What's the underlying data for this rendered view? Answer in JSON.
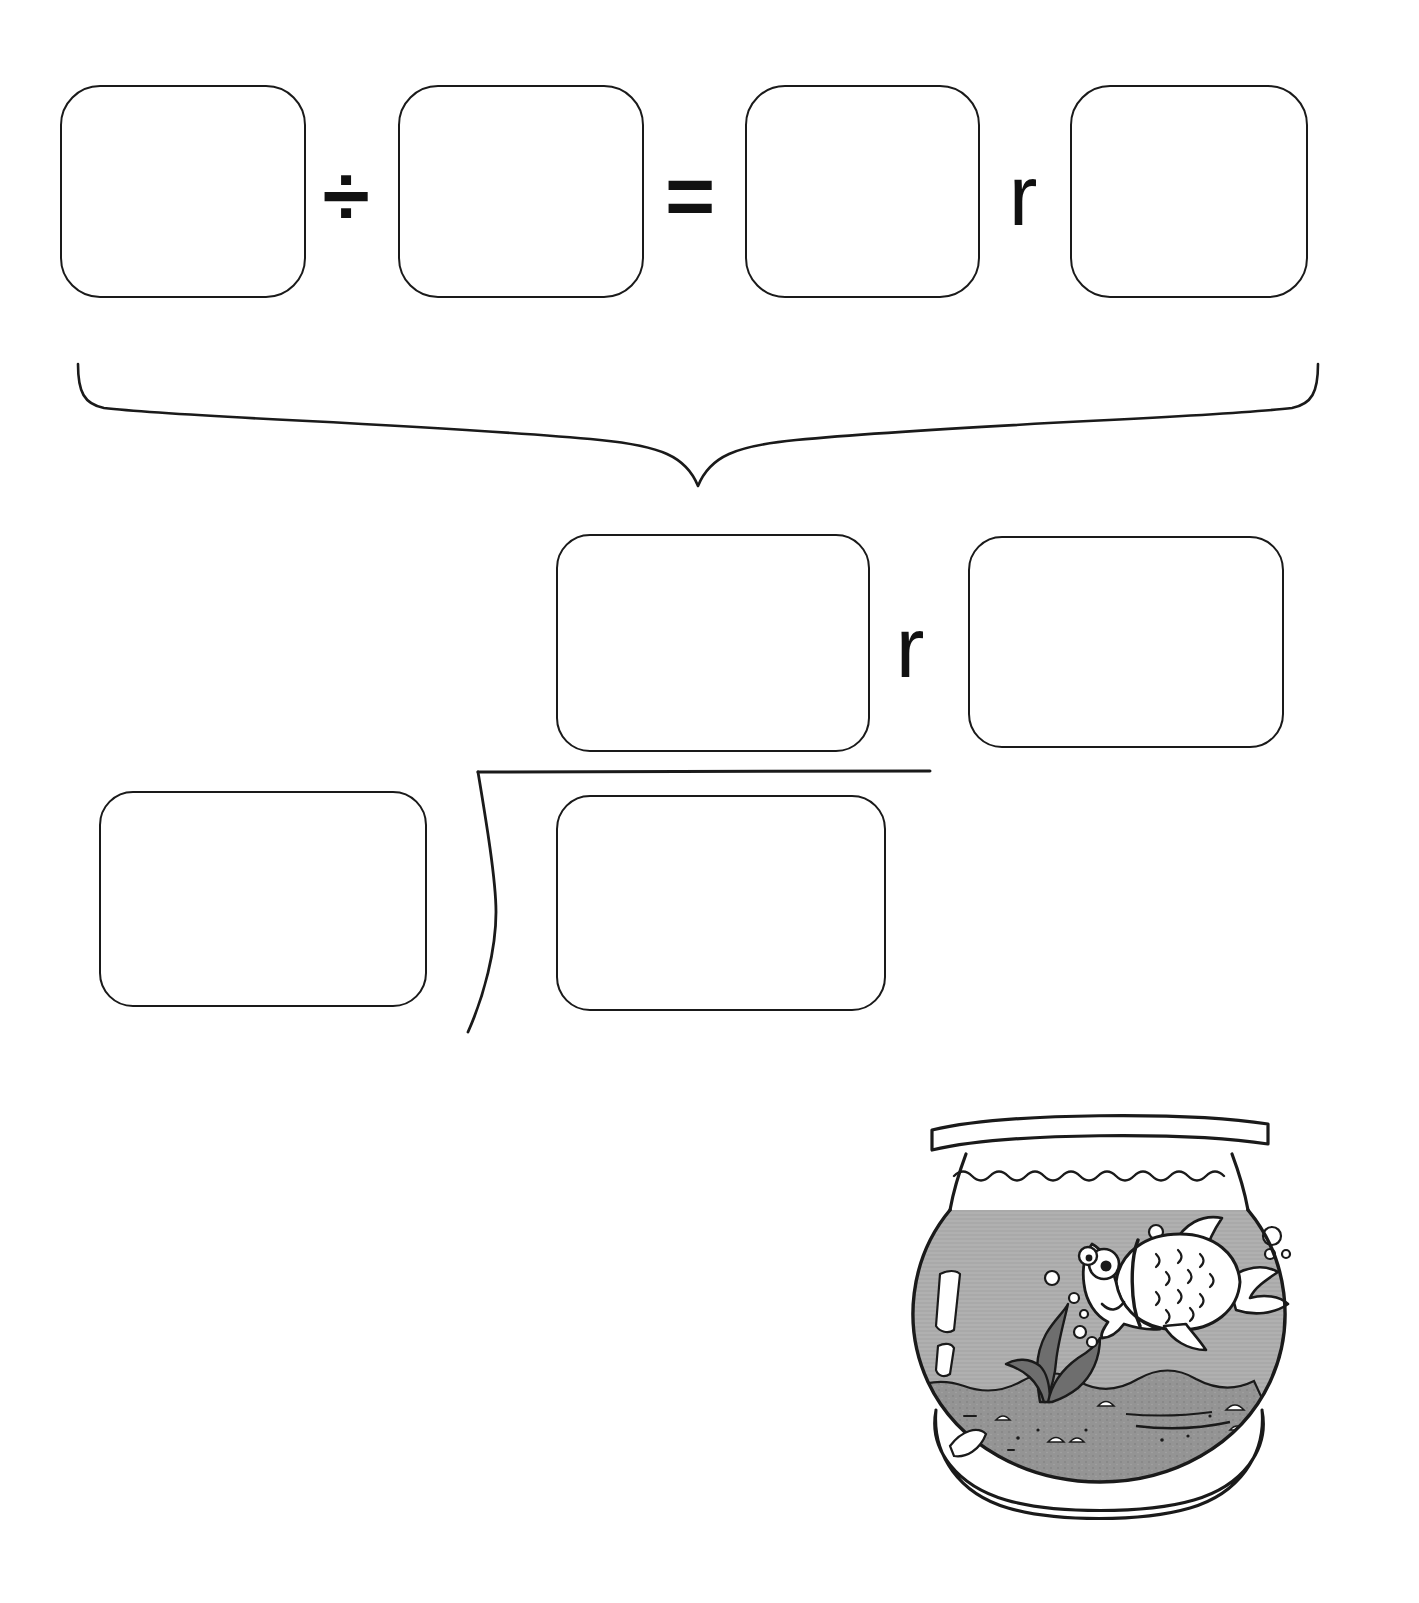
{
  "worksheet": {
    "kind": "long-division-practice",
    "line_color": "#1a1a1a",
    "paper_color": "#ffffff"
  },
  "equation_row": {
    "dividend_box": {
      "label": "",
      "placeholder": ""
    },
    "divide_symbol": "÷",
    "divisor_box": {
      "label": "",
      "placeholder": ""
    },
    "equals_symbol": "=",
    "quotient_box": {
      "label": "",
      "placeholder": ""
    },
    "remainder_label": "r",
    "remainder_box": {
      "label": "",
      "placeholder": ""
    }
  },
  "brace": {
    "direction": "down",
    "semantic": "rewrite-as-long-division"
  },
  "long_division": {
    "quotient_box": {
      "label": "",
      "placeholder": ""
    },
    "remainder_label": "r",
    "remainder_box": {
      "label": "",
      "placeholder": ""
    },
    "divisor_box": {
      "label": "",
      "placeholder": ""
    },
    "dividend_box": {
      "label": "",
      "placeholder": ""
    },
    "bracket_symbol": "⟨"
  },
  "illustration": {
    "name": "fishbowl-with-goldfish",
    "alt_text": "A round glass fishbowl with gray water, one cartoon goldfish, air bubbles, a seaweed plant and gravel on the bottom.",
    "water_color": "#a8a8a8",
    "gravel_color": "#8e8e8e",
    "plant_color": "#6e6e6e",
    "glass_color": "#ffffff",
    "outline_color": "#1a1a1a",
    "parts": [
      "rim",
      "glass-bowl",
      "water",
      "waterline",
      "goldfish",
      "bubbles",
      "seaweed",
      "gravel",
      "base-foot",
      "glass-highlights"
    ]
  }
}
